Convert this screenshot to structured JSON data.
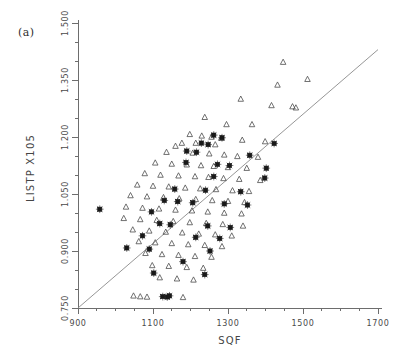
{
  "figure": {
    "panel_label": "(a)",
    "background_color": "#ffffff",
    "axis_color": "#6d6d6d",
    "line_color": "#8a8a8a",
    "triangle_color": "#4d4d4d",
    "star_color": "#1a1a1a"
  },
  "chart_data": {
    "type": "scatter",
    "title": "(a)",
    "xlabel": "SQF",
    "ylabel": "LISTP  X105",
    "xlim": [
      900,
      1700
    ],
    "ylim": [
      0.75,
      1.5
    ],
    "xticks": [
      900,
      1100,
      1300,
      1500,
      1700
    ],
    "xticklabels": [
      "900",
      "1100",
      "1300",
      "1500",
      "1700"
    ],
    "xminor_step": 50,
    "yticks": [
      0.75,
      0.9,
      1.05,
      1.2,
      1.35,
      1.5
    ],
    "yticklabels": [
      "0.750",
      "0.900",
      "1.050",
      "1.200",
      "1.350",
      "1.500"
    ],
    "yminor_step": 0.05,
    "grid": false,
    "legend": null,
    "reference_line": {
      "name": "regression-line",
      "x": [
        900,
        1700
      ],
      "y": [
        0.75,
        1.43
      ]
    },
    "series": [
      {
        "name": "triangle-group",
        "marker": "open-triangle",
        "points": [
          [
            1447,
            1.397
          ],
          [
            1512,
            1.352
          ],
          [
            1432,
            1.337
          ],
          [
            1334,
            1.3
          ],
          [
            1416,
            1.283
          ],
          [
            1472,
            1.28
          ],
          [
            1481,
            1.277
          ],
          [
            1238,
            1.252
          ],
          [
            1296,
            1.233
          ],
          [
            1364,
            1.233
          ],
          [
            1198,
            1.207
          ],
          [
            1230,
            1.203
          ],
          [
            1256,
            1.2
          ],
          [
            1282,
            1.197
          ],
          [
            1338,
            1.192
          ],
          [
            1399,
            1.188
          ],
          [
            1177,
            1.184
          ],
          [
            1214,
            1.184
          ],
          [
            1266,
            1.18
          ],
          [
            1160,
            1.176
          ],
          [
            1136,
            1.16
          ],
          [
            1206,
            1.158
          ],
          [
            1250,
            1.156
          ],
          [
            1290,
            1.153
          ],
          [
            1325,
            1.149
          ],
          [
            1380,
            1.147
          ],
          [
            1106,
            1.132
          ],
          [
            1150,
            1.129
          ],
          [
            1190,
            1.127
          ],
          [
            1228,
            1.125
          ],
          [
            1262,
            1.123
          ],
          [
            1300,
            1.12
          ],
          [
            1350,
            1.118
          ],
          [
            1078,
            1.104
          ],
          [
            1120,
            1.1
          ],
          [
            1168,
            1.098
          ],
          [
            1212,
            1.096
          ],
          [
            1248,
            1.094
          ],
          [
            1288,
            1.091
          ],
          [
            1330,
            1.089
          ],
          [
            1386,
            1.086
          ],
          [
            1058,
            1.074
          ],
          [
            1100,
            1.071
          ],
          [
            1142,
            1.069
          ],
          [
            1186,
            1.066
          ],
          [
            1226,
            1.064
          ],
          [
            1268,
            1.062
          ],
          [
            1312,
            1.059
          ],
          [
            1356,
            1.057
          ],
          [
            1040,
            1.046
          ],
          [
            1084,
            1.043
          ],
          [
            1128,
            1.041
          ],
          [
            1170,
            1.038
          ],
          [
            1214,
            1.036
          ],
          [
            1258,
            1.033
          ],
          [
            1300,
            1.031
          ],
          [
            1344,
            1.028
          ],
          [
            1028,
            1.016
          ],
          [
            1072,
            1.013
          ],
          [
            1116,
            1.011
          ],
          [
            1160,
            1.008
          ],
          [
            1204,
            1.006
          ],
          [
            1246,
            1.003
          ],
          [
            1290,
            1.0
          ],
          [
            1336,
            0.998
          ],
          [
            1022,
            0.986
          ],
          [
            1066,
            0.983
          ],
          [
            1110,
            0.981
          ],
          [
            1154,
            0.978
          ],
          [
            1198,
            0.975
          ],
          [
            1242,
            0.973
          ],
          [
            1286,
            0.97
          ],
          [
            1340,
            0.966
          ],
          [
            1046,
            0.956
          ],
          [
            1090,
            0.953
          ],
          [
            1134,
            0.95
          ],
          [
            1178,
            0.948
          ],
          [
            1222,
            0.945
          ],
          [
            1266,
            0.943
          ],
          [
            1310,
            0.94
          ],
          [
            1062,
            0.925
          ],
          [
            1106,
            0.922
          ],
          [
            1150,
            0.92
          ],
          [
            1194,
            0.917
          ],
          [
            1238,
            0.915
          ],
          [
            1284,
            0.912
          ],
          [
            1080,
            0.894
          ],
          [
            1124,
            0.891
          ],
          [
            1168,
            0.889
          ],
          [
            1212,
            0.886
          ],
          [
            1256,
            0.884
          ],
          [
            1098,
            0.862
          ],
          [
            1142,
            0.86
          ],
          [
            1190,
            0.857
          ],
          [
            1234,
            0.855
          ],
          [
            1118,
            0.83
          ],
          [
            1164,
            0.827
          ],
          [
            1208,
            0.824
          ],
          [
            1048,
            0.782
          ],
          [
            1066,
            0.78
          ],
          [
            1084,
            0.779
          ],
          [
            1180,
            0.778
          ]
        ]
      },
      {
        "name": "star-group",
        "marker": "filled-star-square",
        "points": [
          [
            1423,
            1.183
          ],
          [
            1262,
            1.205
          ],
          [
            1284,
            1.198
          ],
          [
            1229,
            1.184
          ],
          [
            1247,
            1.18
          ],
          [
            1190,
            1.163
          ],
          [
            1216,
            1.16
          ],
          [
            1358,
            1.152
          ],
          [
            1188,
            1.133
          ],
          [
            1272,
            1.128
          ],
          [
            1304,
            1.125
          ],
          [
            1402,
            1.118
          ],
          [
            1262,
            1.096
          ],
          [
            1398,
            1.092
          ],
          [
            1158,
            1.063
          ],
          [
            1240,
            1.06
          ],
          [
            1334,
            1.056
          ],
          [
            1130,
            1.033
          ],
          [
            1166,
            1.03
          ],
          [
            1206,
            1.027
          ],
          [
            1290,
            1.024
          ],
          [
            1352,
            1.021
          ],
          [
            958,
            1.01
          ],
          [
            1096,
            1.003
          ],
          [
            1118,
            0.972
          ],
          [
            1146,
            0.969
          ],
          [
            1246,
            0.966
          ],
          [
            1306,
            0.962
          ],
          [
            1072,
            0.94
          ],
          [
            1214,
            0.936
          ],
          [
            1278,
            0.933
          ],
          [
            1030,
            0.908
          ],
          [
            1090,
            0.905
          ],
          [
            1252,
            0.9
          ],
          [
            1180,
            0.872
          ],
          [
            1102,
            0.842
          ],
          [
            1238,
            0.838
          ],
          [
            1126,
            0.78
          ],
          [
            1138,
            0.779
          ],
          [
            1144,
            0.782
          ]
        ]
      }
    ]
  }
}
